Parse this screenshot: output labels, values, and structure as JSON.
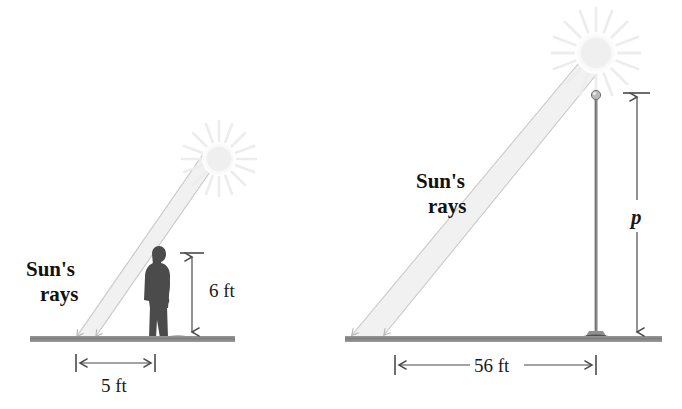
{
  "figure": {
    "background_color": "#ffffff",
    "panels": [
      {
        "id": "person-panel",
        "name": "person-shadow-panel",
        "sun_label": "sun-icon",
        "rays_label_line1": "Sun's",
        "rays_label_line2": "rays",
        "object": "person-silhouette",
        "height_label": "6 ft",
        "shadow_label": "5 ft",
        "height_value": 6,
        "shadow_value": 5,
        "units": "ft"
      },
      {
        "id": "pole-panel",
        "name": "flagpole-shadow-panel",
        "sun_label": "sun-icon",
        "rays_label_line1": "Sun's",
        "rays_label_line2": "rays",
        "object": "flagpole",
        "height_label": "p",
        "shadow_label": "56 ft",
        "height_value": null,
        "shadow_value": 56,
        "units": "ft"
      }
    ],
    "colors": {
      "ground": "#8c8c8c",
      "ground_dark": "#6e6e6e",
      "person": "#4a4a4a",
      "pole": "#8e8e8e",
      "pole_dark": "#6a6a6a",
      "ray_beam": "#f2f2f2",
      "ray_edge": "#d8d8d8",
      "sun": "#f4f4f4",
      "dimension": "#5a5a5a",
      "text": "#1a1a1a"
    }
  }
}
